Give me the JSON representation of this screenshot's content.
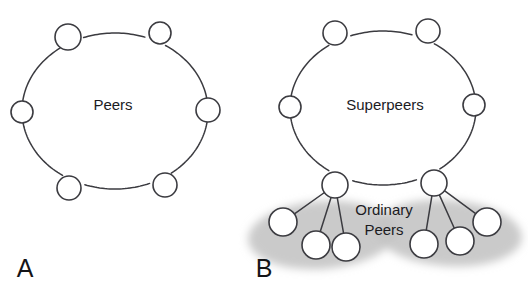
{
  "figure": {
    "title_visible": false,
    "background_color": "#ffffff",
    "stroke_color": "#3b3b40",
    "node_fill_color": "#ffffff",
    "blob_color": "#c6c6c6",
    "text_color": "#1b1b1f"
  },
  "panels": [
    {
      "id": "A",
      "letter": "A",
      "letter_pos": {
        "x": 25,
        "y": 270
      },
      "center_label": "Peers",
      "center_label_pos": {
        "x": 113,
        "y": 106
      },
      "ring": {
        "cx": 115,
        "cy": 111,
        "rx": 93,
        "ry": 78,
        "node_radius": 12,
        "nodes": [
          {
            "name": "peer-node-top-left",
            "x": 68,
            "y": 37,
            "r": 13
          },
          {
            "name": "peer-node-top-right",
            "x": 160,
            "y": 33,
            "r": 11
          },
          {
            "name": "peer-node-right",
            "x": 208,
            "y": 110,
            "r": 12
          },
          {
            "name": "peer-node-bottom-right",
            "x": 165,
            "y": 185,
            "r": 12
          },
          {
            "name": "peer-node-bottom-left",
            "x": 69,
            "y": 188,
            "r": 12
          },
          {
            "name": "peer-node-left",
            "x": 22,
            "y": 112,
            "r": 11
          }
        ]
      }
    },
    {
      "id": "B",
      "letter": "B",
      "letter_pos": {
        "x": 264,
        "y": 270
      },
      "center_label": "Superpeers",
      "center_label_pos": {
        "x": 385,
        "y": 106
      },
      "cluster_label_line1": "Ordinary",
      "cluster_label_line2": "Peers",
      "cluster_label_pos": {
        "x": 384,
        "y": 211
      },
      "ring": {
        "cx": 383,
        "cy": 108,
        "rx": 93,
        "ry": 77,
        "node_radius": 12,
        "nodes": [
          {
            "name": "superpeer-node-top-left",
            "x": 335,
            "y": 33,
            "r": 12
          },
          {
            "name": "superpeer-node-top-right",
            "x": 428,
            "y": 31,
            "r": 12
          },
          {
            "name": "superpeer-node-right",
            "x": 474,
            "y": 105,
            "r": 11
          },
          {
            "name": "superpeer-node-bottom-right",
            "x": 434,
            "y": 183,
            "r": 13
          },
          {
            "name": "superpeer-node-bottom-left",
            "x": 335,
            "y": 185,
            "r": 13
          },
          {
            "name": "superpeer-node-left",
            "x": 290,
            "y": 107,
            "r": 11
          }
        ]
      },
      "clusters": [
        {
          "name": "ordinary-peer-cluster-left",
          "parent": "superpeer-node-bottom-left",
          "parent_pos": {
            "x": 335,
            "y": 185
          },
          "blob": {
            "cx": 322,
            "cy": 235,
            "rx": 74,
            "ry": 34,
            "rotate": -4
          },
          "peers": [
            {
              "name": "ordinary-peer-left-1",
              "x": 283,
              "y": 222,
              "r": 14
            },
            {
              "name": "ordinary-peer-left-2",
              "x": 316,
              "y": 245,
              "r": 14
            },
            {
              "name": "ordinary-peer-left-3",
              "x": 346,
              "y": 247,
              "r": 14
            }
          ]
        },
        {
          "name": "ordinary-peer-cluster-right",
          "parent": "superpeer-node-bottom-right",
          "parent_pos": {
            "x": 434,
            "y": 183
          },
          "blob": {
            "cx": 448,
            "cy": 233,
            "rx": 74,
            "ry": 33,
            "rotate": 4
          },
          "peers": [
            {
              "name": "ordinary-peer-right-1",
              "x": 424,
              "y": 244,
              "r": 14
            },
            {
              "name": "ordinary-peer-right-2",
              "x": 460,
              "y": 241,
              "r": 14
            },
            {
              "name": "ordinary-peer-right-3",
              "x": 487,
              "y": 222,
              "r": 14
            }
          ]
        }
      ]
    }
  ]
}
